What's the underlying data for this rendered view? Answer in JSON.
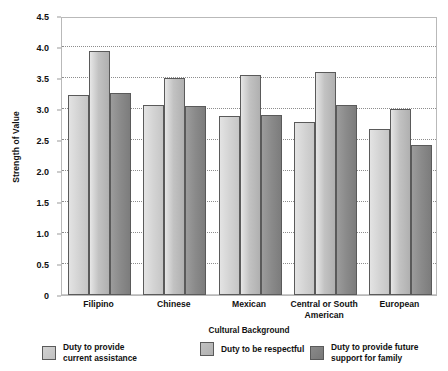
{
  "chart_data": {
    "type": "bar",
    "title": "",
    "xlabel": "Cultural Background",
    "ylabel": "Strength of Value",
    "categories": [
      "Filipino",
      "Chinese",
      "Mexican",
      "Central or South American",
      "European"
    ],
    "series": [
      {
        "name": "Duty to provide current assistance",
        "color": "#d2d2d2",
        "values": [
          3.22,
          3.07,
          2.88,
          2.79,
          2.67
        ]
      },
      {
        "name": "Duty to be respectful",
        "color": "#c2c2c2",
        "values": [
          3.93,
          3.5,
          3.55,
          3.6,
          3.0
        ]
      },
      {
        "name": "Duty to provide future support for family",
        "color": "#8a8a8a",
        "values": [
          3.26,
          3.05,
          2.9,
          3.07,
          2.42
        ]
      }
    ],
    "ylim": [
      0,
      4.5
    ],
    "y_ticks": [
      "0",
      "0.5",
      "1.0",
      "1.5",
      "2.0",
      "2.5",
      "3.0",
      "3.5",
      "4.0",
      "4.5"
    ],
    "y_tick_values": [
      0,
      0.5,
      1.0,
      1.5,
      2.0,
      2.5,
      3.0,
      3.5,
      4.0,
      4.5
    ],
    "grid": "horizontal-dotted",
    "legend_position": "bottom"
  },
  "axes": {
    "y_title": "Strength of Value",
    "x_title": "Cultural Background",
    "x_tick_labels": [
      "Filipino",
      "Chinese",
      "Mexican",
      "Central or South\nAmerican",
      "European"
    ]
  },
  "legend": {
    "items": [
      {
        "label": "Duty to provide\ncurrent assistance",
        "color": "#d2d2d2"
      },
      {
        "label": "Duty to be respectful",
        "color": "#c2c2c2"
      },
      {
        "label": "Duty to provide future\nsupport for family",
        "color": "#8a8a8a"
      }
    ]
  }
}
